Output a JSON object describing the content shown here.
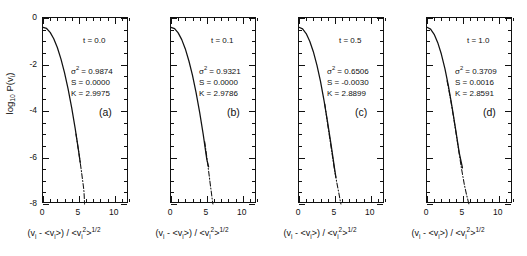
{
  "figure": {
    "type": "multi-panel-line-plot",
    "panel_count": 4,
    "background": "#ffffff",
    "line_color": "#111111"
  },
  "axes": {
    "x_title_html": "(v<sub>i</sub> - &lt;v<sub>i</sub>&gt;) / &lt;v<sub>i</sub><sup>2</sup>&gt;<sup>1/2</sup>",
    "y_title_html": "log<sub>10</sub> P(v<sub>i</sub>)",
    "x_ticks": [
      "0",
      "5",
      "10"
    ],
    "x_tick_values": [
      0,
      5,
      10
    ],
    "y_ticks": [
      "0",
      "-2",
      "-4",
      "-6",
      "-8"
    ],
    "y_tick_values": [
      0,
      -2,
      -4,
      -6,
      -8
    ],
    "xlim": [
      0,
      12
    ],
    "ylim": [
      -8,
      0
    ],
    "x_minor_step": 1,
    "y_minor_step": 0.5,
    "grid": "off",
    "ticks_direction": "in",
    "legend": "none"
  },
  "chart_data": {
    "type": "line",
    "title": "",
    "xlabel": "(v_i - <v_i>) / <v_i^2>^1/2",
    "ylabel": "log10 P(v_i)",
    "xlim": [
      0,
      12
    ],
    "ylim": [
      -8,
      0
    ],
    "grid": false,
    "legend_position": "none",
    "panels": [
      {
        "id": "a",
        "panel_label": "(a)",
        "time_label": "t = 0.0",
        "time_value": 0.0,
        "variance_label": "σ² = 0.9874",
        "variance_value": 0.9874,
        "skewness_label": "S = 0.0000",
        "skewness_value": 0.0,
        "kurtosis_label": "K = 2.9975",
        "kurtosis_value": 2.9975,
        "series": [
          {
            "name": "measured distribution",
            "style": "solid",
            "x": [
              0.0,
              0.5,
              1.0,
              1.5,
              2.0,
              2.5,
              3.0,
              3.5,
              4.0,
              4.5,
              5.0,
              5.2
            ],
            "y": [
              -0.4,
              -0.45,
              -0.62,
              -0.89,
              -1.27,
              -1.76,
              -2.35,
              -3.05,
              -3.86,
              -4.77,
              -5.79,
              -6.23
            ]
          },
          {
            "name": "gaussian reference",
            "style": "dash-dot",
            "x": [
              4.6,
              5.0,
              5.4,
              5.6,
              5.7,
              5.75,
              5.8
            ],
            "y": [
              -4.99,
              -5.79,
              -6.68,
              -7.15,
              -7.4,
              -7.65,
              -8.0
            ]
          }
        ]
      },
      {
        "id": "b",
        "panel_label": "(b)",
        "time_label": "t = 0.1",
        "time_value": 0.1,
        "variance_label": "σ² = 0.9321",
        "variance_value": 0.9321,
        "skewness_label": "S = 0.0000",
        "skewness_value": 0.0,
        "kurtosis_label": "K = 2.9786",
        "kurtosis_value": 2.9786,
        "series": [
          {
            "name": "measured distribution",
            "style": "solid",
            "x": [
              0.0,
              0.5,
              1.0,
              1.5,
              2.0,
              2.5,
              3.0,
              3.5,
              4.0,
              4.5,
              5.0,
              5.25
            ],
            "y": [
              -0.4,
              -0.46,
              -0.64,
              -0.93,
              -1.33,
              -1.85,
              -2.47,
              -3.21,
              -4.06,
              -5.02,
              -6.09,
              -6.4
            ]
          },
          {
            "name": "gaussian reference",
            "style": "dash-dot",
            "x": [
              4.7,
              5.1,
              5.45,
              5.65,
              5.75,
              5.8,
              5.85
            ],
            "y": [
              -5.31,
              -6.22,
              -7.08,
              -7.55,
              -7.8,
              -7.92,
              -8.0
            ]
          }
        ]
      },
      {
        "id": "c",
        "panel_label": "(c)",
        "time_label": "t = 0.5",
        "time_value": 0.5,
        "variance_label": "σ² = 0.6506",
        "variance_value": 0.6506,
        "skewness_label": "S = -0.0030",
        "skewness_value": -0.003,
        "kurtosis_label": "K = 2.8899",
        "kurtosis_value": 2.8899,
        "series": [
          {
            "name": "measured distribution",
            "style": "solid",
            "x": [
              0.0,
              0.5,
              1.0,
              1.5,
              2.0,
              2.5,
              3.0,
              3.5,
              4.0,
              4.5,
              5.0,
              5.15
            ],
            "y": [
              -0.4,
              -0.47,
              -0.67,
              -1.0,
              -1.45,
              -2.03,
              -2.73,
              -3.56,
              -4.5,
              -5.5,
              -6.55,
              -6.85
            ]
          },
          {
            "name": "gaussian reference",
            "style": "dash-dot",
            "x": [
              3.6,
              4.0,
              4.5,
              5.0,
              5.35,
              5.6,
              5.75,
              5.85
            ],
            "y": [
              -3.7,
              -4.58,
              -5.6,
              -6.62,
              -7.2,
              -7.6,
              -7.85,
              -8.0
            ]
          }
        ]
      },
      {
        "id": "d",
        "panel_label": "(d)",
        "time_label": "t = 1.0",
        "time_value": 1.0,
        "variance_label": "σ² = 0.3709",
        "variance_value": 0.3709,
        "skewness_label": "S = 0.0016",
        "skewness_value": 0.0016,
        "kurtosis_label": "K = 2.8591",
        "kurtosis_value": 2.8591,
        "series": [
          {
            "name": "measured distribution",
            "style": "solid",
            "x": [
              0.0,
              0.5,
              1.0,
              1.5,
              2.0,
              2.5,
              3.0,
              3.5,
              4.0,
              4.5,
              4.95
            ],
            "y": [
              -0.4,
              -0.48,
              -0.7,
              -1.06,
              -1.55,
              -2.18,
              -2.94,
              -3.83,
              -4.8,
              -5.8,
              -6.45
            ]
          },
          {
            "name": "gaussian reference",
            "style": "dash-dot",
            "x": [
              2.8,
              3.3,
              3.8,
              4.3,
              4.8,
              5.2,
              5.5,
              5.7,
              5.85
            ],
            "y": [
              -2.7,
              -3.52,
              -4.45,
              -5.45,
              -6.45,
              -7.15,
              -7.58,
              -7.82,
              -8.0
            ]
          }
        ]
      }
    ]
  }
}
